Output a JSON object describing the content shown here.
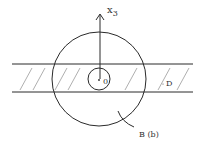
{
  "diagram": {
    "axis_label": "x",
    "axis_subscript": "3",
    "origin_label": "0",
    "region_label": "D",
    "ball_label": "B (b)",
    "colors": {
      "stroke": "#2a2a2a",
      "hatch": "#8a8a8a",
      "background": "#ffffff"
    }
  }
}
